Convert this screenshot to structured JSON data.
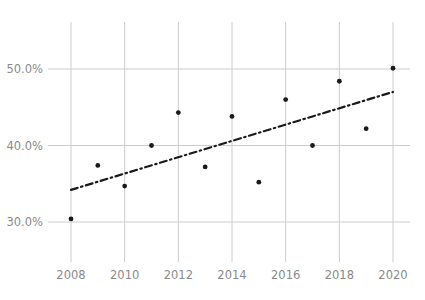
{
  "chart_data": {
    "type": "scatter",
    "title": "",
    "subtitle": "",
    "xlabel": "",
    "ylabel": "",
    "x": [
      2008,
      2009,
      2010,
      2011,
      2012,
      2013,
      2014,
      2015,
      2016,
      2017,
      2018,
      2019,
      2020
    ],
    "values": [
      30.4,
      37.4,
      34.7,
      40.0,
      44.3,
      37.2,
      43.8,
      35.2,
      46.0,
      40.0,
      48.4,
      42.2,
      50.1
    ],
    "series": [
      {
        "name": "data-points",
        "style": "scatter",
        "marker": "circle",
        "color": "#1a1a1a",
        "x": [
          2008,
          2009,
          2010,
          2011,
          2012,
          2013,
          2014,
          2015,
          2016,
          2017,
          2018,
          2019,
          2020
        ],
        "values": [
          30.4,
          37.4,
          34.7,
          40.0,
          44.3,
          37.2,
          43.8,
          35.2,
          46.0,
          40.0,
          48.4,
          42.2,
          50.1
        ]
      },
      {
        "name": "trend-line",
        "style": "line",
        "dash": "dash-dot",
        "color": "#1a1a1a",
        "x": [
          2008,
          2020
        ],
        "values": [
          34.2,
          47.0
        ]
      }
    ],
    "xlim": [
      2007.1,
      2020.9
    ],
    "ylim": [
      26.6,
      53.6
    ],
    "xticks": [
      2008,
      2010,
      2012,
      2014,
      2016,
      2018,
      2020
    ],
    "xticklabels": [
      "2008",
      "2010",
      "2012",
      "2014",
      "2016",
      "2018",
      "2020"
    ],
    "yticks": [
      30.0,
      40.0,
      50.0
    ],
    "yticklabels": [
      "30.0%",
      "40.0%",
      "50.0%"
    ],
    "grid": {
      "x": true,
      "y": true,
      "color": "#cccccc"
    },
    "legend": {
      "visible": false,
      "position": "none"
    },
    "annotations": []
  },
  "colors": {
    "background": "#ffffff",
    "grid": "#cccccc",
    "marker": "#1a1a1a",
    "trend": "#1a1a1a",
    "tick_text": "#8a8a8a"
  }
}
